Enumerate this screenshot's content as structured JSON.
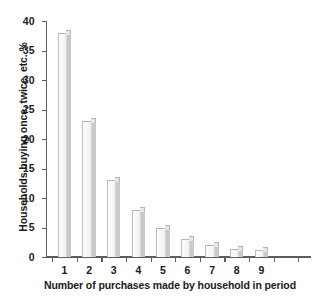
{
  "chart_data": {
    "type": "bar",
    "title": "",
    "xlabel": "Number of purchases made by household in period",
    "ylabel": "Households buying once, twice, etc. %",
    "categories": [
      "1",
      "2",
      "3",
      "4",
      "5",
      "6",
      "7",
      "8",
      "9"
    ],
    "values": [
      38,
      23,
      13,
      8,
      5,
      3,
      2,
      1.4,
      1.2
    ],
    "ylim": [
      0,
      40
    ],
    "yticks": [
      0,
      5,
      10,
      15,
      20,
      25,
      30,
      35,
      40
    ],
    "ytick_labels": [
      "0",
      "5",
      "10",
      "15",
      "20",
      "25",
      "30",
      "35",
      "40"
    ],
    "xtick_labels": [
      "1",
      "2",
      "3",
      "4",
      "5",
      "6",
      "7",
      "8",
      "9"
    ],
    "extra_unlabeled_xticks": 3,
    "grid": false,
    "legend": false,
    "legend_position": "none",
    "bar_face_color": "#f2f2f2",
    "bar_side_color": "#c9c9c9",
    "bar_edge_color": "#b4b4b4",
    "axis_color": "#5d5d5d",
    "background_color": "#ffffff"
  }
}
